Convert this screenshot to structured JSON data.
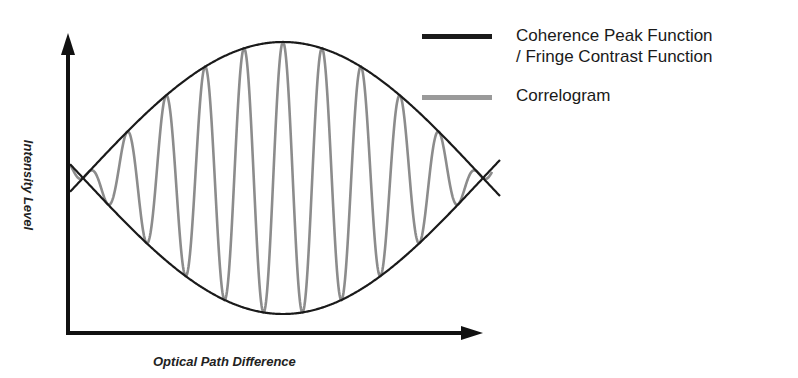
{
  "chart_data": {
    "type": "line",
    "title": "",
    "xlabel": "Optical Path Difference",
    "ylabel": "Intensity Level",
    "grid": false,
    "legend_position": "top-right",
    "ticks": "none",
    "series": [
      {
        "name": "Coherence Peak Function / Fringe Contrast Function",
        "legend_lines": [
          "Coherence Peak Function",
          "/ Fringe Contrast Function"
        ],
        "color": "#1a1a1a",
        "description": "Symmetric cosine-shaped envelope (upper and lower branches) peaking at center OPD, crossing near both ends"
      },
      {
        "name": "Correlogram",
        "color": "#8c8c8c",
        "description": "Oscillating interference fringes bounded by the envelope, maximum amplitude at zero OPD (center)"
      }
    ],
    "geometry": {
      "origin_px": [
        68,
        333
      ],
      "x_axis_end_px": 482,
      "y_axis_top_px": 35,
      "center_x_px": 283,
      "mid_y_px": 178,
      "envelope_amplitude_px": 136,
      "envelope_half_period_px": 200,
      "fringe_period_px": 39,
      "curve_x_range_px": [
        70,
        500
      ]
    }
  },
  "legend": {
    "items": [
      {
        "label_line1": "Coherence Peak Function",
        "label_line2": "/ Fringe Contrast Function",
        "color": "#1a1a1a"
      },
      {
        "label_line1": "Correlogram",
        "color": "#8c8c8c"
      }
    ]
  }
}
